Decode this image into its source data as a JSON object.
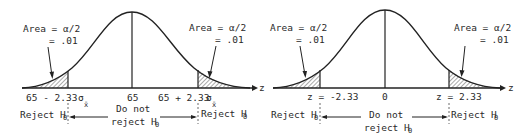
{
  "panels": [
    {
      "name": "sample-mean-scale",
      "left_area_label": [
        "Area = α/2",
        "= .01"
      ],
      "right_area_label": [
        "Area = α/2",
        "= .01"
      ],
      "axis_label": "z",
      "ticks": {
        "left": "65 - 2.33",
        "center": "65",
        "right": "65 + 2.33",
        "sigma": "σ",
        "sigma_sub": "x̄"
      },
      "regions": {
        "reject_left": "Reject H",
        "reject_right": "Reject H",
        "accept_line1": "Do not",
        "accept_line2": "reject H",
        "h_sub": "0"
      }
    },
    {
      "name": "z-scale",
      "left_area_label": [
        "Area = α/2",
        "= .01"
      ],
      "right_area_label": [
        "Area = α/2",
        "= .01"
      ],
      "axis_label": "z",
      "ticks": {
        "left": "z = -2.33",
        "center": "0",
        "right": "z = 2.33"
      },
      "regions": {
        "reject_left": "Reject H",
        "reject_right": "Reject H",
        "accept_line1": "Do not",
        "accept_line2": "reject H",
        "h_sub": "0"
      }
    }
  ]
}
